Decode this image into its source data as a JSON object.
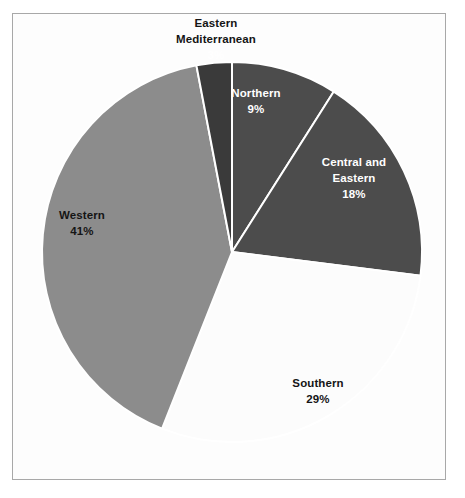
{
  "chart_data": {
    "type": "pie",
    "title": "",
    "subtitle": "",
    "xlabel": "",
    "ylabel": "",
    "legend_position": "none",
    "grid": false,
    "labels_inside": true,
    "center": {
      "x": 232,
      "y": 252
    },
    "radius": 190,
    "start_angle_deg": 0,
    "direction": "clockwise",
    "categories": [
      "Northern",
      "Central and Eastern",
      "Southern",
      "Western",
      "Eastern Mediterranean"
    ],
    "values": [
      9,
      18,
      29,
      41,
      3
    ],
    "value_suffix": "%",
    "slice_colors": [
      "#4c4c4c",
      "#4c4c4c",
      "#fcfcfc",
      "#8c8c8c",
      "#3a3a3a"
    ],
    "slice_separator_color": "#ffffff",
    "slices": [
      {
        "name": "Northern",
        "value": 9,
        "value_label": "9%",
        "color": "#4c4c4c",
        "label_color": "#ffffff",
        "label_placement": "inside"
      },
      {
        "name_line1": "Central and",
        "name_line2": "Eastern",
        "name": "Central and Eastern",
        "value": 18,
        "value_label": "18%",
        "color": "#4c4c4c",
        "label_color": "#ffffff",
        "label_placement": "inside"
      },
      {
        "name": "Southern",
        "value": 29,
        "value_label": "29%",
        "color": "#fcfcfc",
        "label_color": "#151515",
        "label_placement": "inside"
      },
      {
        "name": "Western",
        "value": 41,
        "value_label": "41%",
        "color": "#8c8c8c",
        "label_color": "#151515",
        "label_placement": "inside"
      },
      {
        "name_line1": "Eastern",
        "name_line2": "Mediterranean",
        "name": "Eastern Mediterranean",
        "value": 3,
        "value_label": "3%",
        "color": "#3a3a3a",
        "label_color": "#151515",
        "value_label_color": "#ffffff",
        "label_placement": "outside-top"
      }
    ]
  },
  "frame": {
    "border_color": "#a8a8a8",
    "background_color": "#fdfdfd"
  }
}
